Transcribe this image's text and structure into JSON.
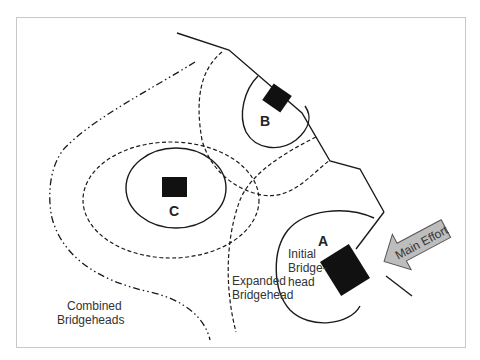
{
  "diagram": {
    "labels": {
      "objective_a": "A",
      "objective_b": "B",
      "objective_c": "C",
      "initial_line1": "Initial",
      "initial_line2": "Bridge-",
      "initial_line3": "head",
      "expanded_line1": "Expanded",
      "expanded_line2": "Bridgehead",
      "combined_line1": "Combined",
      "combined_line2": "Bridgeheads",
      "main_effort": "Main Effort"
    },
    "colors": {
      "frame": "#c8c8c8",
      "line": "#1a1a1a",
      "objective_fill": "#111111",
      "arrow_fill": "#bdbdbd",
      "arrow_stroke": "#555555"
    },
    "legend_line_styles": {
      "initial_bridgehead": "solid",
      "expanded_bridgehead": "dashed",
      "combined_bridgeheads": "dash-dot"
    }
  }
}
